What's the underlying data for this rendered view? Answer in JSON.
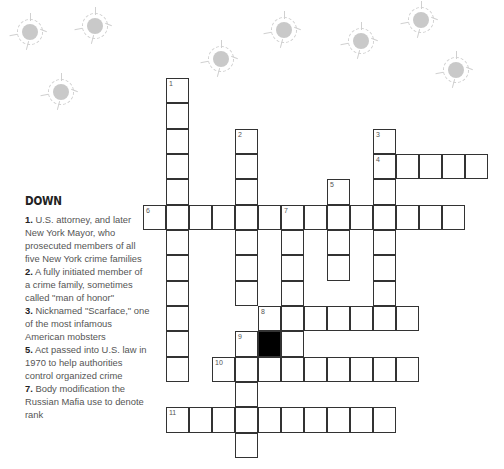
{
  "clues": {
    "heading": "DOWN",
    "down": [
      {
        "num": "1.",
        "text": " U.S. attorney, and later New York Mayor, who prosecuted members of all five New York crime families"
      },
      {
        "num": "2.",
        "text": " A fully initiated member of a crime family, sometimes called \"man of honor\""
      },
      {
        "num": "3.",
        "text": " Nicknamed \"Scarface,\" one of the most infamous American mobsters"
      },
      {
        "num": "5.",
        "text": " Act passed into U.S. law in 1970 to help authorities control organized crime"
      },
      {
        "num": "7.",
        "text": " Body modification the Russian Mafia use to denote rank"
      }
    ]
  },
  "grid": {
    "origin_x": 143,
    "origin_y": 78,
    "cell_w": 23,
    "cell_h": 25.33,
    "numbers": [
      {
        "label": "1",
        "col": 1,
        "row": 0
      },
      {
        "label": "2",
        "col": 4,
        "row": 2
      },
      {
        "label": "3",
        "col": 10,
        "row": 2
      },
      {
        "label": "4",
        "col": 10,
        "row": 3
      },
      {
        "label": "5",
        "col": 8,
        "row": 4
      },
      {
        "label": "6",
        "col": 0,
        "row": 5
      },
      {
        "label": "7",
        "col": 6,
        "row": 5
      },
      {
        "label": "8",
        "col": 5,
        "row": 9
      },
      {
        "label": "9",
        "col": 4,
        "row": 10
      },
      {
        "label": "10",
        "col": 3,
        "row": 11
      },
      {
        "label": "11",
        "col": 1,
        "row": 13
      }
    ],
    "words": [
      {
        "id": "1-down",
        "col": 1,
        "row": 0,
        "dir": "down",
        "len": 12
      },
      {
        "id": "2-down",
        "col": 4,
        "row": 2,
        "dir": "down",
        "len": 7
      },
      {
        "id": "3-down",
        "col": 10,
        "row": 2,
        "dir": "down",
        "len": 8
      },
      {
        "id": "4-across",
        "col": 10,
        "row": 3,
        "dir": "across",
        "len": 5
      },
      {
        "id": "5-down",
        "col": 8,
        "row": 4,
        "dir": "down",
        "len": 4
      },
      {
        "id": "6-across",
        "col": 0,
        "row": 5,
        "dir": "across",
        "len": 14
      },
      {
        "id": "7-down",
        "col": 6,
        "row": 5,
        "dir": "down",
        "len": 7
      },
      {
        "id": "8-across",
        "col": 5,
        "row": 9,
        "dir": "across",
        "len": 7
      },
      {
        "id": "9-down",
        "col": 4,
        "row": 10,
        "dir": "down",
        "len": 5
      },
      {
        "id": "10-across",
        "col": 3,
        "row": 11,
        "dir": "across",
        "len": 9
      },
      {
        "id": "11-across",
        "col": 1,
        "row": 13,
        "dir": "across",
        "len": 10
      }
    ],
    "black_cells": [
      {
        "col": 5,
        "row": 10
      }
    ]
  },
  "decor": {
    "bullet_holes": [
      {
        "x": 30,
        "y": 32
      },
      {
        "x": 95,
        "y": 26
      },
      {
        "x": 61,
        "y": 92
      },
      {
        "x": 221,
        "y": 59
      },
      {
        "x": 284,
        "y": 30
      },
      {
        "x": 361,
        "y": 41
      },
      {
        "x": 421,
        "y": 20
      },
      {
        "x": 456,
        "y": 70
      }
    ]
  }
}
